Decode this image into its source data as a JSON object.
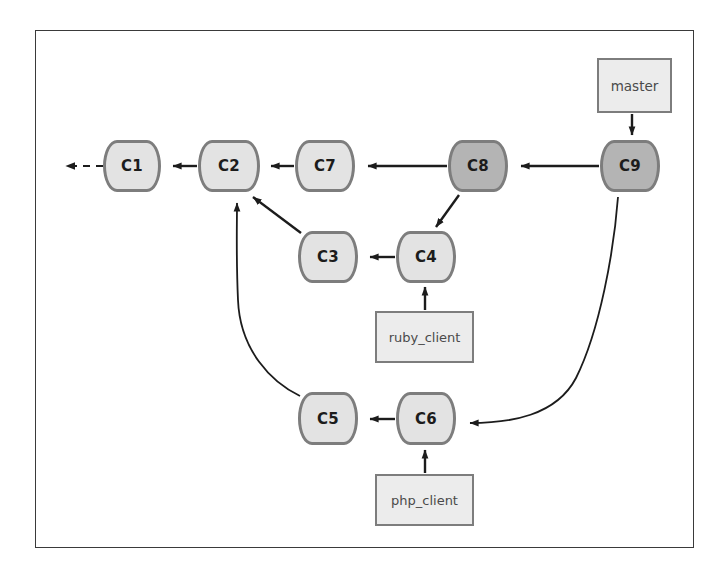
{
  "diagram": {
    "frame": {
      "x": 35,
      "y": 30,
      "w": 659,
      "h": 518
    },
    "colors": {
      "commit_light_fill": "#e3e3e3",
      "commit_dark_fill": "#b4b4b4",
      "commit_border": "#7d7d7d",
      "label_fill": "#ececec",
      "label_border": "#7d7d7d",
      "edge_stroke": "#1c1c1c",
      "frame_border": "#3a3a3a",
      "background": "#ffffff"
    },
    "commits": [
      {
        "id": "c1",
        "label": "C1",
        "x": 103,
        "y": 140,
        "w": 58,
        "h": 52,
        "shade": "light"
      },
      {
        "id": "c2",
        "label": "C2",
        "x": 198,
        "y": 140,
        "w": 62,
        "h": 52,
        "shade": "light"
      },
      {
        "id": "c7",
        "label": "C7",
        "x": 295,
        "y": 140,
        "w": 60,
        "h": 52,
        "shade": "light"
      },
      {
        "id": "c8",
        "label": "C8",
        "x": 448,
        "y": 140,
        "w": 60,
        "h": 52,
        "shade": "dark"
      },
      {
        "id": "c9",
        "label": "C9",
        "x": 600,
        "y": 140,
        "w": 60,
        "h": 52,
        "shade": "dark"
      },
      {
        "id": "c3",
        "label": "C3",
        "x": 298,
        "y": 231,
        "w": 60,
        "h": 52,
        "shade": "light"
      },
      {
        "id": "c4",
        "label": "C4",
        "x": 396,
        "y": 231,
        "w": 60,
        "h": 52,
        "shade": "light"
      },
      {
        "id": "c5",
        "label": "C5",
        "x": 298,
        "y": 392,
        "w": 60,
        "h": 53,
        "shade": "light"
      },
      {
        "id": "c6",
        "label": "C6",
        "x": 396,
        "y": 392,
        "w": 60,
        "h": 53,
        "shade": "light"
      }
    ],
    "labels": [
      {
        "id": "master",
        "label": "master",
        "x": 597,
        "y": 58,
        "w": 75,
        "h": 55
      },
      {
        "id": "ruby_client",
        "label": "ruby_client",
        "x": 375,
        "y": 311,
        "w": 99,
        "h": 52
      },
      {
        "id": "php_client",
        "label": "php_client",
        "x": 375,
        "y": 474,
        "w": 99,
        "h": 52
      }
    ],
    "edges": [
      {
        "id": "c1-to-offscreen",
        "from": "c1",
        "to": "offscreen-left",
        "style": "dashed",
        "arrow": "left"
      },
      {
        "id": "c2-to-c1",
        "from": "c2",
        "to": "c1",
        "style": "solid",
        "arrow": "left"
      },
      {
        "id": "c7-to-c2",
        "from": "c7",
        "to": "c2",
        "style": "solid",
        "arrow": "left"
      },
      {
        "id": "c8-to-c7",
        "from": "c8",
        "to": "c7",
        "style": "solid",
        "arrow": "left"
      },
      {
        "id": "c9-to-c8",
        "from": "c9",
        "to": "c8",
        "style": "solid",
        "arrow": "left"
      },
      {
        "id": "c3-to-c2",
        "from": "c3",
        "to": "c2",
        "style": "solid",
        "arrow": "up-left"
      },
      {
        "id": "c4-to-c3",
        "from": "c4",
        "to": "c3",
        "style": "solid",
        "arrow": "left"
      },
      {
        "id": "c8-to-c4",
        "from": "c8",
        "to": "c4",
        "style": "solid",
        "arrow": "down-left"
      },
      {
        "id": "c5-to-c2",
        "from": "c5",
        "to": "c2",
        "style": "solid-curved",
        "arrow": "up"
      },
      {
        "id": "c6-to-c5",
        "from": "c6",
        "to": "c5",
        "style": "solid",
        "arrow": "left"
      },
      {
        "id": "c9-to-c6",
        "from": "c9",
        "to": "c6",
        "style": "solid-curved",
        "arrow": "left"
      },
      {
        "id": "master-to-c9",
        "from": "master",
        "to": "c9",
        "style": "solid",
        "arrow": "down"
      },
      {
        "id": "ruby_client-to-c4",
        "from": "ruby_client",
        "to": "c4",
        "style": "solid",
        "arrow": "up"
      },
      {
        "id": "php_client-to-c6",
        "from": "php_client",
        "to": "c6",
        "style": "solid",
        "arrow": "up"
      }
    ]
  }
}
